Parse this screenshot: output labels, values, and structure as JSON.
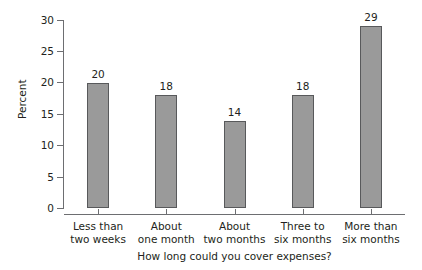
{
  "chart_data": {
    "type": "bar",
    "title": "",
    "subtitle": "",
    "xlabel": "How long could you cover expenses?",
    "ylabel": "Percent",
    "categories": [
      "Less than two weeks",
      "About one month",
      "About two months",
      "Three to six months",
      "More than six months"
    ],
    "category_lines": [
      [
        "Less than",
        "two weeks"
      ],
      [
        "About",
        "one month"
      ],
      [
        "About",
        "two months"
      ],
      [
        "Three to",
        "six months"
      ],
      [
        "More than",
        "six months"
      ]
    ],
    "values": [
      20,
      18,
      14,
      18,
      29
    ],
    "data_labels": [
      "20",
      "18",
      "14",
      "18",
      "29"
    ],
    "ylim": [
      0,
      30
    ],
    "ytick_values": [
      0,
      5,
      10,
      15,
      20,
      25,
      30
    ],
    "ytick_labels": [
      "0",
      "5",
      "10",
      "15",
      "20",
      "25",
      "30"
    ],
    "grid": false,
    "legend": null,
    "legend_position": "none",
    "bar_color": "#9a9a9a",
    "bar_edge_color": "#58595b",
    "axis_color": "#6d6e71",
    "text_color": "#231f20",
    "background_color": "#ffffff"
  }
}
